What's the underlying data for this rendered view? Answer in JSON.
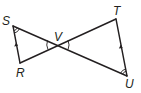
{
  "diagram": {
    "type": "geometry-figure",
    "points": [
      {
        "name": "S",
        "x": 13,
        "y": 26
      },
      {
        "name": "R",
        "x": 20,
        "y": 63
      },
      {
        "name": "V",
        "x": 58,
        "y": 45
      },
      {
        "name": "T",
        "x": 116,
        "y": 19
      },
      {
        "name": "U",
        "x": 127,
        "y": 76
      }
    ],
    "labels": {
      "S": "S",
      "R": "R",
      "V": "V",
      "T": "T",
      "U": "U"
    },
    "segments": [
      "SR",
      "SU",
      "RT",
      "TU"
    ],
    "parallel_marks": [
      "SR",
      "TU"
    ],
    "angle_marks": [
      {
        "vertex": "S",
        "arcs": 2
      },
      {
        "vertex": "U",
        "arcs": 2
      },
      {
        "vertex": "V",
        "arcs": 1,
        "pair": "vertical angles SVR and TVU"
      }
    ],
    "stroke_color": "#231f20",
    "background": "#ffffff"
  }
}
